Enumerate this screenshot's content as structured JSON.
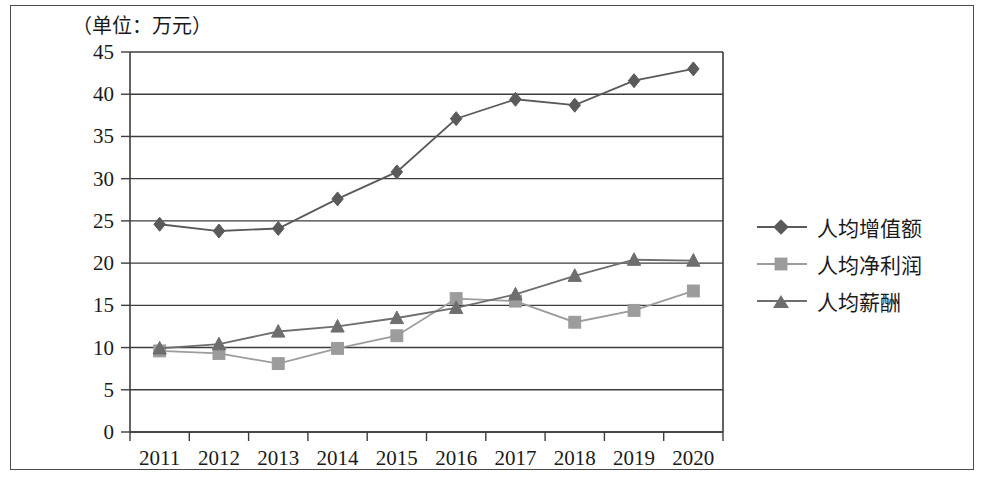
{
  "unit_note": "（单位：万元）",
  "chart_data": {
    "type": "line",
    "title": "",
    "subtitle": "",
    "xlabel": "",
    "ylabel": "",
    "unit_note": "（单位：万元）",
    "categories": [
      "2011",
      "2012",
      "2013",
      "2014",
      "2015",
      "2016",
      "2017",
      "2018",
      "2019",
      "2020"
    ],
    "series": [
      {
        "name": "人均增值额",
        "marker": "diamond",
        "color": "#5a5a5a",
        "values": [
          24.6,
          23.8,
          24.1,
          27.6,
          30.8,
          37.1,
          39.4,
          38.7,
          41.6,
          43.0
        ]
      },
      {
        "name": "人均净利润",
        "marker": "square",
        "color": "#9c9c9c",
        "values": [
          9.6,
          9.3,
          8.1,
          9.9,
          11.4,
          15.8,
          15.5,
          13.0,
          14.4,
          16.7
        ]
      },
      {
        "name": "人均薪酬",
        "marker": "triangle",
        "color": "#6e6e6e",
        "values": [
          9.9,
          10.4,
          11.9,
          12.5,
          13.5,
          14.7,
          16.3,
          18.5,
          20.4,
          20.3
        ]
      }
    ],
    "ylim": [
      0,
      45
    ],
    "ytick_values": [
      0,
      5,
      10,
      15,
      20,
      25,
      30,
      35,
      40,
      45
    ],
    "ytick_labels": [
      "0",
      "5",
      "10",
      "15",
      "20",
      "25",
      "30",
      "35",
      "40",
      "45"
    ],
    "grid": true,
    "grid_axis": "y",
    "legend_position": "right"
  },
  "legend": {
    "items": [
      {
        "label": "人均增值额",
        "marker": "diamond",
        "color": "#5a5a5a"
      },
      {
        "label": "人均净利润",
        "marker": "square",
        "color": "#9c9c9c"
      },
      {
        "label": "人均薪酬",
        "marker": "triangle",
        "color": "#6e6e6e"
      }
    ]
  }
}
